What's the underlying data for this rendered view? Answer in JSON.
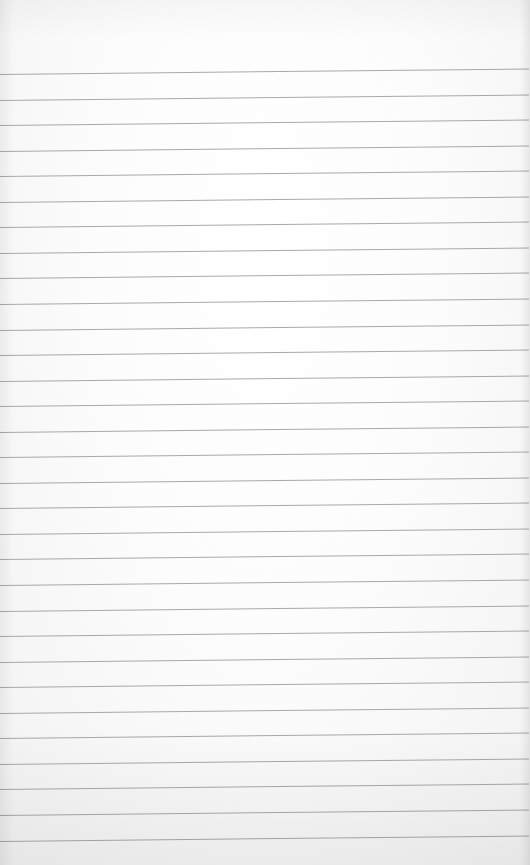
{
  "page": {
    "type": "lined-notepad-paper",
    "background_color": "#fbfbfb",
    "rule_color": "#9a9a9a",
    "rule_count": 31,
    "first_rule_y_left": 74,
    "rule_spacing_px": 25.55,
    "rule_slope_deg": -0.6,
    "text_content": ""
  }
}
